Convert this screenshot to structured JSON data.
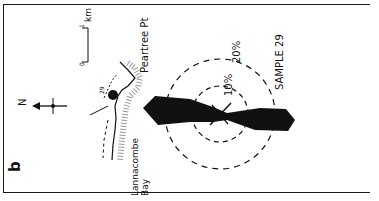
{
  "figure": {
    "panel_label": "b",
    "scale_bar": {
      "start": "0",
      "end": "1",
      "unit": "km"
    },
    "north_arrow": "N",
    "place_labels": [
      "Peartree Pt",
      "Lannacombe",
      "Bay"
    ],
    "sample_marker": "29",
    "rose": {
      "title": "SAMPLE 29",
      "rings": [
        "10%",
        "20%"
      ]
    }
  }
}
